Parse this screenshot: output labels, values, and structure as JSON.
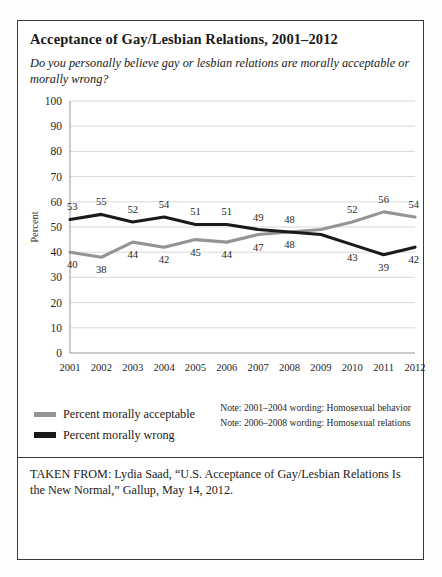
{
  "figure": {
    "title": "Acceptance of Gay/Lesbian Relations, 2001–2012",
    "subtitle": "Do you personally believe gay or lesbian relations are morally acceptable or morally wrong?",
    "source": "TAKEN FROM: Lydia Saad, “U.S. Acceptance of Gay/Lesbian Relations Is the New Normal,” Gallup, May 14, 2012."
  },
  "legend": {
    "items": [
      {
        "label": "Percent morally acceptable",
        "color": "#949494",
        "key": "acceptable"
      },
      {
        "label": "Percent morally wrong",
        "color": "#1a1a1a",
        "key": "wrong"
      }
    ]
  },
  "notes": [
    "Note: 2001–2004 wording: Homosexual behavior",
    "Note: 2006–2008 wording: Homosexual relations"
  ],
  "chart_data": {
    "type": "line",
    "title": "Acceptance of Gay/Lesbian Relations, 2001–2012",
    "xlabel": "",
    "ylabel": "Percent",
    "ylim": [
      0,
      100
    ],
    "ytick_step": 10,
    "yticks": [
      0,
      10,
      20,
      30,
      40,
      50,
      60,
      70,
      80,
      90,
      100
    ],
    "grid": true,
    "legend_position": "bottom-left",
    "categories": [
      "2001",
      "2002",
      "2003",
      "2004",
      "2005",
      "2006",
      "2007",
      "2008",
      "2009",
      "2010",
      "2011",
      "2012"
    ],
    "series": [
      {
        "name": "Percent morally acceptable",
        "color": "#949494",
        "values": [
          40,
          38,
          44,
          42,
          45,
          44,
          47,
          48,
          49,
          52,
          56,
          54
        ],
        "labels": [
          "40",
          "38",
          "44",
          "42",
          "45",
          "44",
          "47",
          "48",
          "",
          "52",
          "56",
          "54"
        ],
        "label_side": [
          "below",
          "below",
          "below",
          "below",
          "below",
          "below",
          "below",
          "below",
          "",
          "above",
          "above",
          "above"
        ]
      },
      {
        "name": "Percent morally wrong",
        "color": "#1a1a1a",
        "values": [
          53,
          55,
          52,
          54,
          51,
          51,
          49,
          48,
          47,
          43,
          39,
          42
        ],
        "labels": [
          "53",
          "55",
          "52",
          "54",
          "51",
          "51",
          "49",
          "48",
          "",
          "43",
          "39",
          "42"
        ],
        "label_side": [
          "above",
          "above",
          "above",
          "above",
          "above",
          "above",
          "above",
          "above",
          "",
          "below",
          "below",
          "below"
        ]
      }
    ]
  }
}
